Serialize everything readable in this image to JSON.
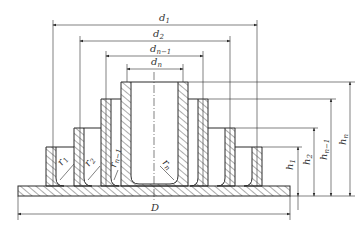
{
  "diagram": {
    "line_color": "#2b2b2b",
    "hatch_color": "#444444",
    "diameter_labels": [
      {
        "base": "d",
        "sub": "1"
      },
      {
        "base": "d",
        "sub": "2"
      },
      {
        "base": "d",
        "sub": "n−1"
      },
      {
        "base": "d",
        "sub": "n"
      }
    ],
    "height_labels": [
      {
        "base": "h",
        "sub": "1"
      },
      {
        "base": "h",
        "sub": "2"
      },
      {
        "base": "h",
        "sub": "n−1"
      },
      {
        "base": "h",
        "sub": "n"
      }
    ],
    "radius_labels": [
      {
        "base": "r",
        "sub": "1"
      },
      {
        "base": "r",
        "sub": "2"
      },
      {
        "base": "r",
        "sub": "n−1"
      },
      {
        "base": "r",
        "sub": "n"
      }
    ],
    "base_diameter_label": "D"
  }
}
